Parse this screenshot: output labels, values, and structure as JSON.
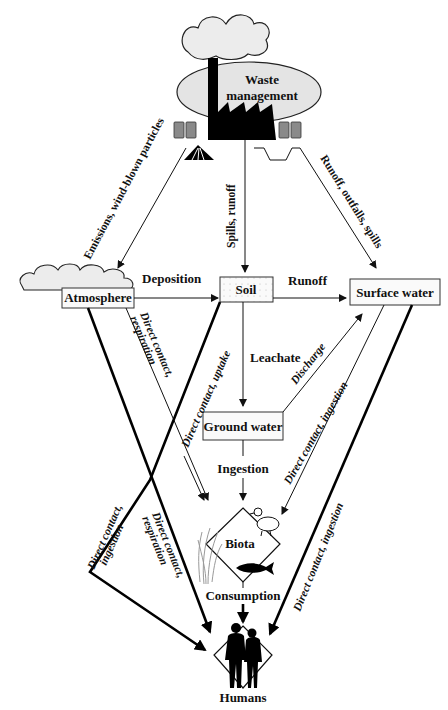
{
  "diagram": {
    "colors": {
      "ink": "#111111",
      "box_fill": "#fafafa",
      "ellipse_fill": "#e4e4e4",
      "cloud_fill": "#ececec",
      "bin_fill": "#8a8a8a",
      "grass": "#9a9a9a"
    },
    "nodes": {
      "source": "Waste management",
      "source_line1": "Waste",
      "source_line2": "management",
      "atmosphere": "Atmosphere",
      "soil": "Soil",
      "surface_water": "Surface water",
      "ground_water": "Ground water",
      "biota": "Biota",
      "humans": "Humans"
    },
    "edges": [
      {
        "from": "Waste management",
        "to": "Atmosphere",
        "label": "Emissions, wind-blown particles"
      },
      {
        "from": "Waste management",
        "to": "Soil",
        "label": "Spills, runoff"
      },
      {
        "from": "Waste management",
        "to": "Surface water",
        "label": "Runoff, outfalls, spills"
      },
      {
        "from": "Atmosphere",
        "to": "Soil",
        "label": "Deposition"
      },
      {
        "from": "Soil",
        "to": "Surface water",
        "label": "Runoff"
      },
      {
        "from": "Soil",
        "to": "Ground water",
        "label": "Leachate"
      },
      {
        "from": "Ground water",
        "to": "Surface water",
        "label": "Discharge"
      },
      {
        "from": "Ground water",
        "to": "Biota",
        "label": "Ingestion"
      },
      {
        "from": "Atmosphere",
        "to": "Biota",
        "label": "Direct contact, respiration"
      },
      {
        "from": "Soil",
        "to": "Humans",
        "label": "Direct contact, uptake"
      },
      {
        "from": "Surface water",
        "to": "Biota",
        "label": "Direct contact, ingestion"
      },
      {
        "from": "Biota",
        "to": "Humans",
        "label": "Consumption"
      },
      {
        "from": "Atmosphere",
        "to": "Humans",
        "label": "Direct contact, respiration"
      },
      {
        "from": "Soil",
        "to": "Humans",
        "label": "Direct contact, ingestion"
      },
      {
        "from": "Surface water",
        "to": "Humans",
        "label": "Direct contact, ingestion"
      }
    ],
    "labels": {
      "emissions": "Emissions, wind-blown particles",
      "spills_runoff": "Spills, runoff",
      "runoff_outfalls": "Runoff, outfalls, spills",
      "deposition": "Deposition",
      "runoff": "Runoff",
      "leachate": "Leachate",
      "discharge": "Discharge",
      "ingestion": "Ingestion",
      "atm_biota": "Direct contact,",
      "atm_biota2": "respiration",
      "soil_uptake": "Direct contact, uptake",
      "sw_biota": "Direct contact, ingestion",
      "consumption": "Consumption",
      "soil_humans": "Direct contact,",
      "soil_humans2": "ingestion",
      "atm_humans": "Direct contact,",
      "atm_humans2": "respiration",
      "sw_humans": "Direct contact, ingestion"
    },
    "icons": [
      "smoke-cloud-icon",
      "factory-icon",
      "trash-bin-icon",
      "landfill-pile-icon",
      "lagoon-pit-icon",
      "cloud-icon",
      "duck-icon",
      "fish-icon",
      "grass-icon",
      "people-silhouette-icon"
    ]
  }
}
